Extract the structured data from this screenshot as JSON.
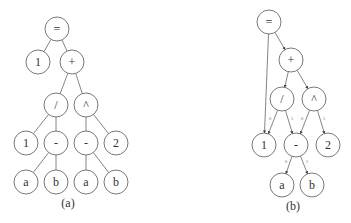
{
  "diagram_a": {
    "caption": "(a)",
    "node_radius": 12,
    "nodes": [
      {
        "id": "eq",
        "label": "=",
        "x": 57,
        "y": 29
      },
      {
        "id": "one_top",
        "label": "1",
        "x": 38,
        "y": 62
      },
      {
        "id": "plus",
        "label": "+",
        "x": 72,
        "y": 62
      },
      {
        "id": "div",
        "label": "/",
        "x": 56,
        "y": 105
      },
      {
        "id": "pow",
        "label": "^",
        "x": 86,
        "y": 105
      },
      {
        "id": "one",
        "label": "1",
        "x": 26,
        "y": 143
      },
      {
        "id": "minus1",
        "label": "-",
        "x": 56,
        "y": 143
      },
      {
        "id": "minus2",
        "label": "-",
        "x": 86,
        "y": 143
      },
      {
        "id": "two",
        "label": "2",
        "x": 116,
        "y": 143
      },
      {
        "id": "a1",
        "label": "a",
        "x": 26,
        "y": 182
      },
      {
        "id": "b1",
        "label": "b",
        "x": 56,
        "y": 182
      },
      {
        "id": "a2",
        "label": "a",
        "x": 86,
        "y": 182
      },
      {
        "id": "b2",
        "label": "b",
        "x": 116,
        "y": 182
      }
    ],
    "edges": [
      [
        "eq",
        "one_top"
      ],
      [
        "eq",
        "plus"
      ],
      [
        "plus",
        "div"
      ],
      [
        "plus",
        "pow"
      ],
      [
        "div",
        "one"
      ],
      [
        "div",
        "minus1"
      ],
      [
        "pow",
        "minus2"
      ],
      [
        "pow",
        "two"
      ],
      [
        "minus1",
        "a1"
      ],
      [
        "minus1",
        "b1"
      ],
      [
        "minus2",
        "a2"
      ],
      [
        "minus2",
        "b2"
      ]
    ],
    "caption_pos": {
      "x": 68,
      "y": 207
    }
  },
  "diagram_b": {
    "caption": "(b)",
    "node_radius": 12,
    "nodes": [
      {
        "id": "eq",
        "label": "=",
        "x": 269,
        "y": 22
      },
      {
        "id": "plus",
        "label": "+",
        "x": 291,
        "y": 60
      },
      {
        "id": "div",
        "label": "/",
        "x": 282,
        "y": 99
      },
      {
        "id": "pow",
        "label": "^",
        "x": 314,
        "y": 99
      },
      {
        "id": "one",
        "label": "1",
        "x": 264,
        "y": 145
      },
      {
        "id": "minus",
        "label": "-",
        "x": 296,
        "y": 145
      },
      {
        "id": "two",
        "label": "2",
        "x": 328,
        "y": 145
      },
      {
        "id": "a",
        "label": "a",
        "x": 282,
        "y": 185
      },
      {
        "id": "b",
        "label": "b",
        "x": 312,
        "y": 185
      }
    ],
    "edges": [
      {
        "from": "eq",
        "to": "one",
        "label": ""
      },
      {
        "from": "eq",
        "to": "plus",
        "label": ""
      },
      {
        "from": "plus",
        "to": "div",
        "label": ""
      },
      {
        "from": "plus",
        "to": "pow",
        "label": ""
      },
      {
        "from": "div",
        "to": "one",
        "label": "0"
      },
      {
        "from": "div",
        "to": "minus",
        "label": "1"
      },
      {
        "from": "pow",
        "to": "minus",
        "label": "0"
      },
      {
        "from": "pow",
        "to": "two",
        "label": "1"
      },
      {
        "from": "minus",
        "to": "a",
        "label": "0"
      },
      {
        "from": "minus",
        "to": "b",
        "label": "1"
      }
    ],
    "caption_pos": {
      "x": 293,
      "y": 210
    }
  },
  "colors": {
    "stroke": "#555555",
    "text": "#333333",
    "background": "#ffffff"
  }
}
